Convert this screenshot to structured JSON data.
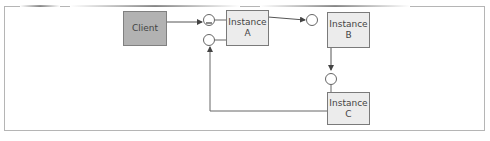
{
  "diagram": {
    "nodes": [
      {
        "id": "client",
        "label_lines": [
          "Client"
        ],
        "fill": "#b2b2b2"
      },
      {
        "id": "instance-a",
        "label_lines": [
          "Instance",
          "A"
        ],
        "fill": "#ececec"
      },
      {
        "id": "instance-b",
        "label_lines": [
          "Instance",
          "B"
        ],
        "fill": "#ececec"
      },
      {
        "id": "instance-c",
        "label_lines": [
          "Instance",
          "C"
        ],
        "fill": "#ececec"
      }
    ],
    "edges": [
      {
        "from": "client",
        "to": "instance-a",
        "via": "interface-circle"
      },
      {
        "from": "instance-a",
        "to": "instance-b",
        "via": "interface-circle"
      },
      {
        "from": "instance-b",
        "to": "instance-c",
        "via": "interface-circle"
      },
      {
        "from": "instance-c",
        "to": "instance-a",
        "via": "interface-circle"
      }
    ]
  }
}
